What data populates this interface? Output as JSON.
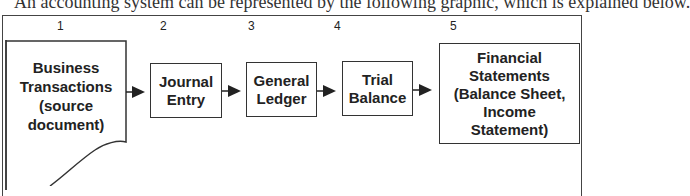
{
  "caption": "An accounting system can be represented by the following graphic, which is explained below.",
  "steps": [
    {
      "number": "1",
      "label": "Business\nTransactions\n(source\ndocument)"
    },
    {
      "number": "2",
      "label": "Journal\nEntry"
    },
    {
      "number": "3",
      "label": "General\nLedger"
    },
    {
      "number": "4",
      "label": "Trial\nBalance"
    },
    {
      "number": "5",
      "label": "Financial\nStatements\n(Balance Sheet,\nIncome\nStatement)"
    }
  ],
  "colors": {
    "stroke": "#333333",
    "text": "#222222",
    "background": "#ffffff"
  }
}
